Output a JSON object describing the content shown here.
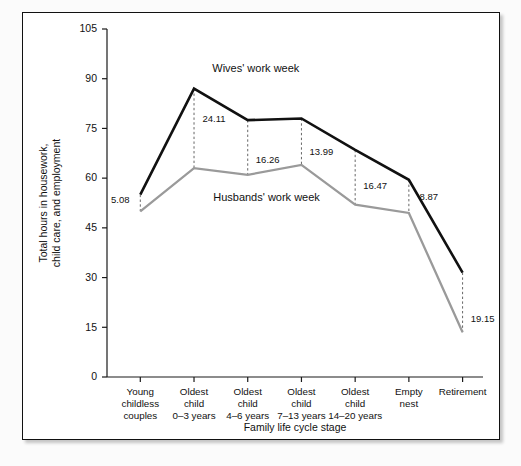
{
  "figure": {
    "background_color": "#ffffff",
    "border_color": "#111111"
  },
  "chart_data": {
    "type": "line",
    "title": "",
    "xlabel": "Family life cycle stage",
    "ylabel": "Total hours in housework, child care, and employment",
    "ylabel_line1": "Total hours in housework,",
    "ylabel_line2": "child care, and employment",
    "ylim": [
      0,
      105
    ],
    "yticks": [
      0,
      15,
      30,
      45,
      60,
      75,
      90,
      105
    ],
    "ytick_labels": [
      "0",
      "15",
      "30",
      "45",
      "60",
      "75",
      "90",
      "105"
    ],
    "grid": false,
    "legend_position": "inline-annotation",
    "categories": [
      "Young childless couples",
      "Oldest child 0–3 years",
      "Oldest child 4–6 years",
      "Oldest child 7–13 years",
      "Oldest child 14–20 years",
      "Empty nest",
      "Retirement"
    ],
    "category_lines": [
      [
        "Young",
        "childless",
        "couples"
      ],
      [
        "Oldest",
        "child",
        "0–3 years"
      ],
      [
        "Oldest",
        "child",
        "4–6 years"
      ],
      [
        "Oldest",
        "child",
        "7–13 years"
      ],
      [
        "Oldest",
        "child",
        "14–20 years"
      ],
      [
        "Empty",
        "nest"
      ],
      [
        "Retirement"
      ]
    ],
    "series": [
      {
        "name": "Wives' work week",
        "color": "#111111",
        "values": [
          55.0,
          87.0,
          77.5,
          78.0,
          68.5,
          59.5,
          31.5
        ]
      },
      {
        "name": "Husbands' work week",
        "color": "#9a9a9a",
        "values": [
          50.0,
          63.0,
          61.0,
          64.0,
          52.0,
          49.5,
          13.5
        ]
      }
    ],
    "gap_labels": [
      "5.08",
      "24.11",
      "16.26",
      "13.99",
      "16.47",
      "8.87",
      "19.15"
    ],
    "annotations": [
      {
        "text": "Wives' work week",
        "x_category_index": 2.15,
        "y_value": 92.0
      },
      {
        "text": "Husbands' work week",
        "x_category_index": 2.35,
        "y_value": 53.0
      }
    ]
  }
}
